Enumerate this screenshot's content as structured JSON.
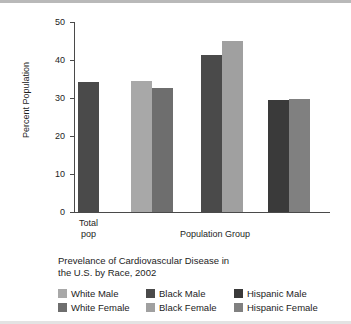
{
  "chart_data": {
    "type": "bar",
    "title": "",
    "xlabel": "Population Group",
    "ylabel": "Percent Population",
    "ylim": [
      0,
      50
    ],
    "ytick_labels": [
      "0",
      "10",
      "20",
      "30",
      "40",
      "50"
    ],
    "ytick_values": [
      0,
      10,
      20,
      30,
      40,
      50
    ],
    "grid": false,
    "legend_position": "below-plot",
    "group_labels": [
      "Total pop",
      "White",
      "Black",
      "Hispanic"
    ],
    "categories": [
      "Total pop",
      "White Male",
      "White Female",
      "Black Male",
      "Black Female",
      "Hispanic Male",
      "Hispanic Female"
    ],
    "values": [
      34.3,
      34.5,
      32.6,
      41.4,
      45.0,
      29.5,
      29.8
    ],
    "bar_colors": [
      "#4a4a4a",
      "#a8a8a8",
      "#6e6e6e",
      "#4a4a4a",
      "#a0a0a0",
      "#3a3a3a",
      "#808080"
    ],
    "xtick_labels": [
      "Total",
      "pop"
    ],
    "annotations": []
  },
  "axis": {
    "y_title": "Percent Population",
    "x_title": "Population Group",
    "x_total_line1": "Total",
    "x_total_line2": "pop"
  },
  "caption": {
    "line1": "Prevelance of Cardiovascular Disease in",
    "line2": "the U.S. by Race, 2002"
  },
  "legend": {
    "rows": [
      [
        {
          "label": "White Male",
          "color": "#a8a8a8"
        },
        {
          "label": "Black Male",
          "color": "#4a4a4a"
        },
        {
          "label": "Hispanic Male",
          "color": "#3a3a3a"
        }
      ],
      [
        {
          "label": "White Female",
          "color": "#6e6e6e"
        },
        {
          "label": "Black Female",
          "color": "#a0a0a0"
        },
        {
          "label": "Hispanic Female",
          "color": "#808080"
        }
      ]
    ]
  }
}
